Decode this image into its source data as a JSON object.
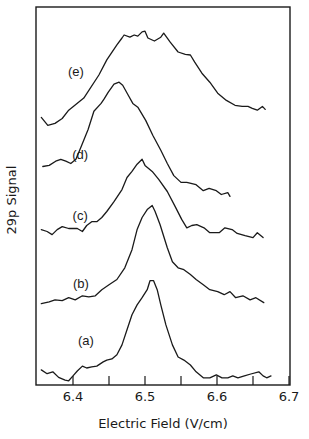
{
  "chart_data": {
    "type": "line",
    "title": "",
    "xlabel": "Electric Field (V/cm)",
    "ylabel": "29p Signal",
    "xlim": [
      6.349,
      6.7
    ],
    "x_ticks": [
      6.4,
      6.5,
      6.6,
      6.7
    ],
    "x_tick_labels": [
      "6.4",
      "6.5",
      "6.6",
      "6.7"
    ],
    "x_minor_ticks": [
      6.45,
      6.55,
      6.65
    ],
    "y_ticks": [],
    "grid": false,
    "legend": "none (inline curve labels)",
    "note": "Vertically offset traces; y in arbitrary units (0 = frame bottom, 1 = frame top)",
    "series": [
      {
        "name": "(a)",
        "label_pos": {
          "x": 6.418,
          "y": 0.12
        },
        "peak_x": 6.512,
        "points": [
          [
            6.356,
            0.04
          ],
          [
            6.364,
            0.03
          ],
          [
            6.372,
            0.035
          ],
          [
            6.38,
            0.02
          ],
          [
            6.389,
            0.013
          ],
          [
            6.394,
            0.011
          ],
          [
            6.4,
            0.024
          ],
          [
            6.406,
            0.037
          ],
          [
            6.413,
            0.05
          ],
          [
            6.419,
            0.045
          ],
          [
            6.426,
            0.048
          ],
          [
            6.433,
            0.05
          ],
          [
            6.442,
            0.061
          ],
          [
            6.447,
            0.066
          ],
          [
            6.454,
            0.069
          ],
          [
            6.461,
            0.08
          ],
          [
            6.468,
            0.106
          ],
          [
            6.475,
            0.146
          ],
          [
            6.482,
            0.186
          ],
          [
            6.489,
            0.212
          ],
          [
            6.496,
            0.231
          ],
          [
            6.503,
            0.252
          ],
          [
            6.507,
            0.276
          ],
          [
            6.512,
            0.276
          ],
          [
            6.517,
            0.252
          ],
          [
            6.522,
            0.212
          ],
          [
            6.529,
            0.159
          ],
          [
            6.538,
            0.106
          ],
          [
            6.546,
            0.074
          ],
          [
            6.554,
            0.066
          ],
          [
            6.563,
            0.053
          ],
          [
            6.571,
            0.035
          ],
          [
            6.581,
            0.019
          ],
          [
            6.59,
            0.019
          ],
          [
            6.599,
            0.027
          ],
          [
            6.607,
            0.019
          ],
          [
            6.615,
            0.019
          ],
          [
            6.622,
            0.024
          ],
          [
            6.629,
            0.019
          ],
          [
            6.638,
            0.024
          ],
          [
            6.647,
            0.029
          ],
          [
            6.658,
            0.035
          ],
          [
            6.664,
            0.024
          ],
          [
            6.669,
            0.019
          ],
          [
            6.675,
            0.024
          ]
        ]
      },
      {
        "name": "(b)",
        "label_pos": {
          "x": 6.411,
          "y": 0.27
        },
        "peak_x": 6.514,
        "points": [
          [
            6.356,
            0.215
          ],
          [
            6.367,
            0.22
          ],
          [
            6.375,
            0.225
          ],
          [
            6.385,
            0.223
          ],
          [
            6.394,
            0.231
          ],
          [
            6.403,
            0.225
          ],
          [
            6.413,
            0.236
          ],
          [
            6.422,
            0.233
          ],
          [
            6.431,
            0.236
          ],
          [
            6.44,
            0.252
          ],
          [
            6.45,
            0.265
          ],
          [
            6.461,
            0.279
          ],
          [
            6.472,
            0.31
          ],
          [
            6.482,
            0.358
          ],
          [
            6.489,
            0.411
          ],
          [
            6.496,
            0.443
          ],
          [
            6.503,
            0.464
          ],
          [
            6.51,
            0.475
          ],
          [
            6.514,
            0.459
          ],
          [
            6.521,
            0.424
          ],
          [
            6.531,
            0.363
          ],
          [
            6.538,
            0.326
          ],
          [
            6.546,
            0.31
          ],
          [
            6.554,
            0.305
          ],
          [
            6.563,
            0.292
          ],
          [
            6.571,
            0.279
          ],
          [
            6.581,
            0.265
          ],
          [
            6.59,
            0.252
          ],
          [
            6.601,
            0.247
          ],
          [
            6.61,
            0.239
          ],
          [
            6.618,
            0.247
          ],
          [
            6.626,
            0.231
          ],
          [
            6.636,
            0.236
          ],
          [
            6.646,
            0.225
          ],
          [
            6.654,
            0.231
          ],
          [
            6.665,
            0.218
          ]
        ]
      },
      {
        "name": "(c)",
        "label_pos": {
          "x": 6.41,
          "y": 0.45
        },
        "peak_x": 6.501,
        "points": [
          [
            6.356,
            0.411
          ],
          [
            6.364,
            0.406
          ],
          [
            6.371,
            0.398
          ],
          [
            6.378,
            0.411
          ],
          [
            6.385,
            0.419
          ],
          [
            6.394,
            0.414
          ],
          [
            6.406,
            0.414
          ],
          [
            6.413,
            0.406
          ],
          [
            6.419,
            0.422
          ],
          [
            6.426,
            0.432
          ],
          [
            6.433,
            0.432
          ],
          [
            6.44,
            0.443
          ],
          [
            6.447,
            0.459
          ],
          [
            6.457,
            0.485
          ],
          [
            6.468,
            0.517
          ],
          [
            6.475,
            0.549
          ],
          [
            6.482,
            0.565
          ],
          [
            6.489,
            0.584
          ],
          [
            6.496,
            0.597
          ],
          [
            6.5,
            0.581
          ],
          [
            6.51,
            0.565
          ],
          [
            6.519,
            0.544
          ],
          [
            6.531,
            0.512
          ],
          [
            6.542,
            0.472
          ],
          [
            6.551,
            0.438
          ],
          [
            6.558,
            0.416
          ],
          [
            6.565,
            0.422
          ],
          [
            6.572,
            0.424
          ],
          [
            6.582,
            0.416
          ],
          [
            6.59,
            0.403
          ],
          [
            6.603,
            0.403
          ],
          [
            6.611,
            0.416
          ],
          [
            6.621,
            0.411
          ],
          [
            6.628,
            0.401
          ],
          [
            6.639,
            0.395
          ],
          [
            6.65,
            0.39
          ],
          [
            6.656,
            0.403
          ],
          [
            6.664,
            0.39
          ]
        ]
      },
      {
        "name": "(d)",
        "label_pos": {
          "x": 6.41,
          "y": 0.61
        },
        "peak_x": 6.508,
        "points": [
          [
            6.358,
            0.578
          ],
          [
            6.367,
            0.581
          ],
          [
            6.376,
            0.592
          ],
          [
            6.383,
            0.597
          ],
          [
            6.39,
            0.592
          ],
          [
            6.397,
            0.586
          ],
          [
            6.404,
            0.597
          ],
          [
            6.411,
            0.629
          ],
          [
            6.421,
            0.676
          ],
          [
            6.429,
            0.724
          ],
          [
            6.439,
            0.745
          ],
          [
            6.443,
            0.756
          ],
          [
            6.449,
            0.775
          ],
          [
            6.457,
            0.796
          ],
          [
            6.464,
            0.801
          ],
          [
            6.469,
            0.793
          ],
          [
            6.476,
            0.769
          ],
          [
            6.483,
            0.745
          ],
          [
            6.49,
            0.735
          ],
          [
            6.501,
            0.7
          ],
          [
            6.511,
            0.66
          ],
          [
            6.522,
            0.621
          ],
          [
            6.531,
            0.586
          ],
          [
            6.54,
            0.554
          ],
          [
            6.55,
            0.536
          ],
          [
            6.558,
            0.536
          ],
          [
            6.571,
            0.53
          ],
          [
            6.581,
            0.514
          ],
          [
            6.589,
            0.52
          ],
          [
            6.599,
            0.514
          ],
          [
            6.606,
            0.504
          ],
          [
            6.615,
            0.509
          ],
          [
            6.618,
            0.499
          ]
        ]
      },
      {
        "name": "(e)",
        "label_pos": {
          "x": 6.404,
          "y": 0.83
        },
        "peak_x": 6.523,
        "points": [
          [
            6.356,
            0.708
          ],
          [
            6.365,
            0.687
          ],
          [
            6.375,
            0.692
          ],
          [
            6.385,
            0.705
          ],
          [
            6.394,
            0.727
          ],
          [
            6.415,
            0.759
          ],
          [
            6.436,
            0.82
          ],
          [
            6.447,
            0.86
          ],
          [
            6.461,
            0.9
          ],
          [
            6.468,
            0.918
          ],
          [
            6.471,
            0.926
          ],
          [
            6.479,
            0.92
          ],
          [
            6.485,
            0.926
          ],
          [
            6.49,
            0.923
          ],
          [
            6.496,
            0.934
          ],
          [
            6.5,
            0.936
          ],
          [
            6.504,
            0.918
          ],
          [
            6.513,
            0.91
          ],
          [
            6.522,
            0.92
          ],
          [
            6.526,
            0.931
          ],
          [
            6.535,
            0.907
          ],
          [
            6.546,
            0.881
          ],
          [
            6.556,
            0.875
          ],
          [
            6.563,
            0.873
          ],
          [
            6.569,
            0.854
          ],
          [
            6.579,
            0.825
          ],
          [
            6.59,
            0.801
          ],
          [
            6.601,
            0.772
          ],
          [
            6.613,
            0.753
          ],
          [
            6.625,
            0.74
          ],
          [
            6.635,
            0.737
          ],
          [
            6.643,
            0.737
          ],
          [
            6.649,
            0.732
          ],
          [
            6.656,
            0.727
          ],
          [
            6.663,
            0.737
          ],
          [
            6.667,
            0.729
          ]
        ]
      }
    ]
  },
  "plot": {
    "frame": {
      "left": 36,
      "top": 7,
      "right": 290,
      "bottom": 385
    },
    "x_px_per_unit": 720,
    "x_origin_px": 73,
    "x_origin_value": 6.4,
    "curve_labels": [
      "(a)",
      "(b)",
      "(c)",
      "(d)",
      "(e)"
    ]
  }
}
